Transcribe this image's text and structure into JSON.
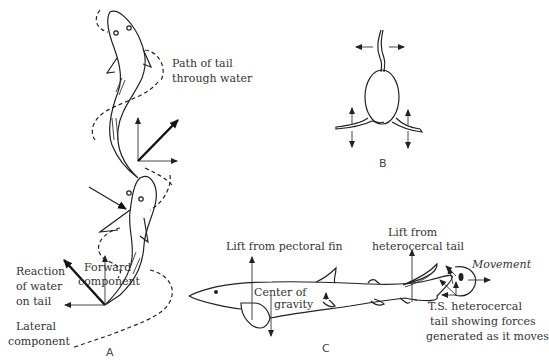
{
  "figure": {
    "panel_a": {
      "caption": "A",
      "labels": {
        "path_of_tail_line1": "Path of tail",
        "path_of_tail_line2": "through water",
        "reaction_line1": "Reaction",
        "reaction_line2": "of water",
        "reaction_line3": "on tail",
        "forward_line1": "Forward",
        "forward_line2": "component",
        "lateral_line1": "Lateral",
        "lateral_line2": "component"
      }
    },
    "panel_b": {
      "caption": "B"
    },
    "panel_c": {
      "caption": "C",
      "labels": {
        "lift_pectoral": "Lift from pectoral fin",
        "lift_tail_line1": "Lift from",
        "lift_tail_line2": "heterocercal tail",
        "center_line1": "Center of",
        "center_line2": "gravity",
        "movement": "Movement",
        "ts_line1": "T.S. heterocercal",
        "ts_line2": "tail showing forces",
        "ts_line3": "generated as it moves"
      }
    }
  }
}
